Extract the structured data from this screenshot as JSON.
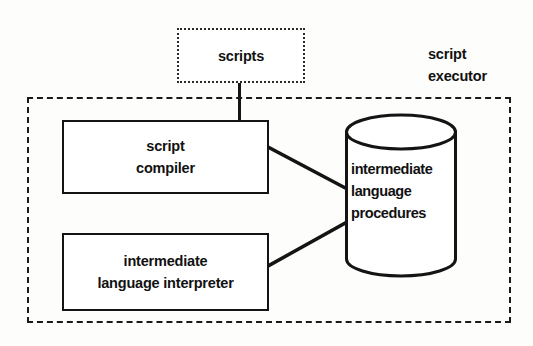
{
  "diagram": {
    "colors": {
      "stroke": "#141414",
      "background": "#fdfdfc",
      "boundary_stroke": "#1a1a1a",
      "source_box_stroke": "#2a2a2a"
    },
    "source_box": {
      "name": "scripts",
      "label": "scripts",
      "border_style": "dotted"
    },
    "boundary": {
      "name": "script executor",
      "border_style": "dashed",
      "caption_lines": [
        "script",
        "executor"
      ]
    },
    "process_boxes": [
      {
        "name": "script compiler",
        "lines": [
          "script",
          "compiler"
        ],
        "border_style": "solid"
      },
      {
        "name": "intermediate language interpreter",
        "lines": [
          "intermediate",
          "language interpreter"
        ],
        "border_style": "solid"
      }
    ],
    "data_store": {
      "name": "intermediate language procedures",
      "shape": "cylinder",
      "lines": [
        "intermediate",
        "language",
        "procedures"
      ]
    },
    "connections": [
      {
        "from": "scripts",
        "to": "script compiler",
        "style": "solid"
      },
      {
        "from": "script compiler",
        "to": "intermediate language procedures",
        "style": "solid"
      },
      {
        "from": "intermediate language procedures",
        "to": "intermediate language interpreter",
        "style": "solid"
      }
    ]
  }
}
